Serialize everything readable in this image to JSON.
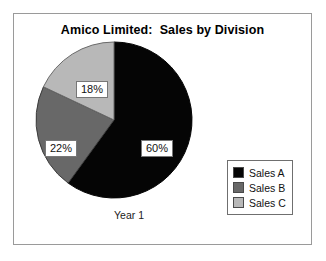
{
  "chart_data": {
    "type": "pie",
    "title": "Amico Limited:  Sales by Division",
    "category_label": "Year 1",
    "xlabel": "",
    "ylabel": "",
    "grid": false,
    "legend_position": "right-bottom",
    "start_angle_deg": 0,
    "direction": "clockwise",
    "categories": [
      "Sales A",
      "Sales B",
      "Sales C"
    ],
    "values": [
      60,
      22,
      18
    ],
    "data_labels": [
      "60%",
      "22%",
      "18%"
    ],
    "colors": [
      "#050505",
      "#686868",
      "#b8b8b8"
    ],
    "slices": [
      {
        "name": "Sales A",
        "value": 60,
        "label": "60%",
        "color": "#050505",
        "start_deg": 0,
        "end_deg": 216
      },
      {
        "name": "Sales B",
        "value": 22,
        "label": "22%",
        "color": "#686868",
        "start_deg": 216,
        "end_deg": 295.2
      },
      {
        "name": "Sales C",
        "value": 18,
        "label": "18%",
        "color": "#b8b8b8",
        "start_deg": 295.2,
        "end_deg": 360
      }
    ]
  },
  "chart": {
    "title": "Amico Limited:  Sales by Division",
    "category_label": "Year 1"
  },
  "labels": {
    "sales_a": "60%",
    "sales_b": "22%",
    "sales_c": "18%"
  },
  "legend": {
    "items": [
      {
        "label": "Sales A",
        "color": "#050505"
      },
      {
        "label": "Sales B",
        "color": "#686868"
      },
      {
        "label": "Sales C",
        "color": "#b8b8b8"
      }
    ]
  }
}
